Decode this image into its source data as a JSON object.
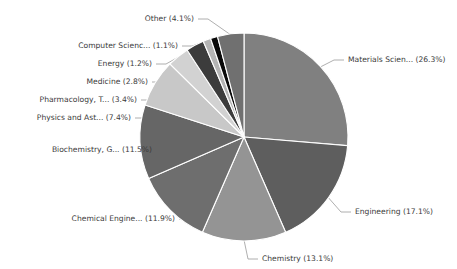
{
  "chart_data": {
    "type": "pie",
    "title": "",
    "subtitle": "",
    "xlabel": "",
    "ylabel": "",
    "legend_position": "external-labels",
    "grid": false,
    "label_format": "{name} ({percent}%)",
    "background_color": "#ffffff",
    "label_text_color": "#3a3a3a",
    "leader_line_color": "#9a9a9a",
    "slice_border_color": "#ffffff",
    "categories": [
      "Materials Scien...",
      "Engineering",
      "Chemistry",
      "Chemical Engine...",
      "Biochemistry, G...",
      "Physics and Ast...",
      "Pharmacology, T...",
      "Medicine",
      "Energy",
      "Computer Scienc...",
      "Other"
    ],
    "values": [
      26.3,
      17.1,
      13.1,
      11.9,
      11.5,
      7.4,
      3.4,
      2.8,
      1.2,
      1.1,
      4.1
    ],
    "colors": [
      "#808080",
      "#5e5e5e",
      "#949494",
      "#6e6e6e",
      "#666666",
      "#c8c8c8",
      "#d2d2d2",
      "#3c3c3c",
      "#b4b4b4",
      "#0a0a0a",
      "#707070"
    ],
    "labels": [
      "Materials Scien... (26.3%)",
      "Engineering (17.1%)",
      "Chemistry (13.1%)",
      "Chemical Engine... (11.9%)",
      "Biochemistry, G... (11.5%)",
      "Physics and Ast... (7.4%)",
      "Pharmacology, T... (3.4%)",
      "Medicine (2.8%)",
      "Energy (1.2%)",
      "Computer Scienc... (1.1%)",
      "Other (4.1%)"
    ],
    "label_positions": [
      {
        "x": 348,
        "y": 60,
        "anchor": "start"
      },
      {
        "x": 355,
        "y": 212,
        "anchor": "start"
      },
      {
        "x": 262,
        "y": 259,
        "anchor": "start"
      },
      {
        "x": 175,
        "y": 219,
        "anchor": "end"
      },
      {
        "x": 152,
        "y": 150,
        "anchor": "end"
      },
      {
        "x": 131,
        "y": 118,
        "anchor": "end"
      },
      {
        "x": 137,
        "y": 100,
        "anchor": "end"
      },
      {
        "x": 148,
        "y": 82,
        "anchor": "end"
      },
      {
        "x": 152,
        "y": 64,
        "anchor": "end"
      },
      {
        "x": 178,
        "y": 46,
        "anchor": "end"
      },
      {
        "x": 194,
        "y": 19,
        "anchor": "end"
      }
    ]
  },
  "pie_geometry": {
    "center_x": 244,
    "center_y": 137,
    "radius": 104,
    "start_angle_deg": -90,
    "direction": "clockwise"
  }
}
